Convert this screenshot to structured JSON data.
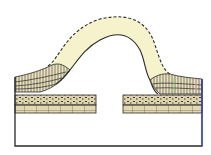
{
  "diagram": {
    "type": "geologic-cross-section",
    "colors": {
      "background": "#ffffff",
      "outline": "#2a2a2a",
      "eroded_fold_fill": "#f6f3cc",
      "strata_fill": "#e6dcb5",
      "hatched_layer_fill": "#e9e1c0",
      "dotted_layer_fill": "#ddd3ad",
      "blocky_layer_fill": "#e3d7b2",
      "right_edge": "#3b4fd0",
      "accent_pink": "#d9a7b8",
      "accent_green": "#7fcf7f"
    },
    "elements": [
      {
        "name": "eroded-fold-outline",
        "style": "dashed",
        "description": "Former extent of folded strata removed by erosion"
      },
      {
        "name": "fold-core-outline",
        "style": "solid",
        "description": "Top surface of remaining folded strata"
      },
      {
        "name": "upturned-strata-left",
        "description": "Steeply dipping hatched beds on left limb"
      },
      {
        "name": "upturned-strata-right",
        "description": "Steeply dipping hatched beds on right limb"
      },
      {
        "name": "horizontal-strata-left",
        "description": "Flat-lying dotted and blocky beds, left"
      },
      {
        "name": "horizontal-strata-right",
        "description": "Flat-lying dotted and blocky beds, right"
      },
      {
        "name": "basement-block",
        "description": "Unpatterned lower block"
      }
    ]
  }
}
